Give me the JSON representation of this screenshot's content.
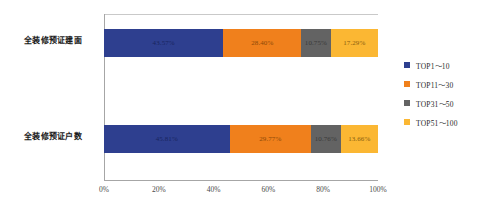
{
  "chart_data": {
    "type": "bar",
    "orientation": "horizontal",
    "stacked": true,
    "normalized_percent": true,
    "title": "",
    "subtitle": "",
    "xlabel": "",
    "ylabel": "",
    "xlim": [
      0,
      100
    ],
    "xticks": [
      "0%",
      "20%",
      "40%",
      "60%",
      "80%",
      "100%"
    ],
    "xtick_values": [
      0,
      20,
      40,
      60,
      80,
      100
    ],
    "grid": false,
    "legend_position": "right",
    "categories": [
      "全装修预证建面",
      "全装修预证户数"
    ],
    "series": [
      {
        "name": "TOP1～10",
        "color": "#2e3f8f",
        "values": [
          43.57,
          45.81
        ],
        "labels": [
          "43.57%",
          "45.81%"
        ]
      },
      {
        "name": "TOP11～30",
        "color": "#f0801c",
        "values": [
          28.4,
          29.77
        ],
        "labels": [
          "28.40%",
          "29.77%"
        ]
      },
      {
        "name": "TOP31～50",
        "color": "#636363",
        "values": [
          10.75,
          10.76
        ],
        "labels": [
          "10.75%",
          "10.76%"
        ]
      },
      {
        "name": "TOP51～100",
        "color": "#fbb733",
        "values": [
          17.29,
          13.66
        ],
        "labels": [
          "17.29%",
          "13.66%"
        ]
      }
    ]
  }
}
